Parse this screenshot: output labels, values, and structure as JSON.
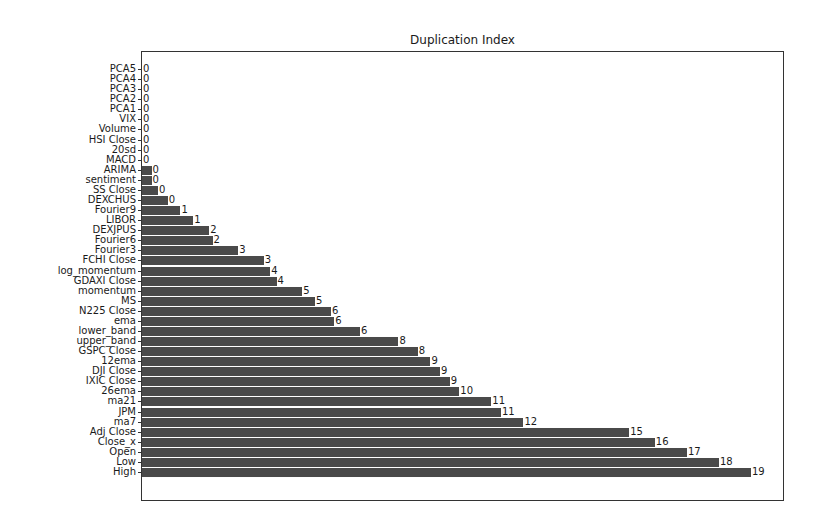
{
  "chart_data": {
    "type": "bar",
    "orientation": "horizontal",
    "title": "Duplication Index",
    "xlabel": "",
    "ylabel": "",
    "xlim": [
      0,
      20
    ],
    "grid": false,
    "legend": null,
    "bar_color": "#4a4a4a",
    "categories": [
      "PCA5",
      "PCA4",
      "PCA3",
      "PCA2",
      "PCA1",
      "VIX",
      "Volume",
      "HSI Close",
      "20sd",
      "MACD",
      "ARIMA",
      "sentiment",
      "SS Close",
      "DEXCHUS",
      "Fourier9",
      "LIBOR",
      "DEXJPUS",
      "Fourier6",
      "Fourier3",
      "FCHI Close",
      "log_momentum",
      "GDAXI Close",
      "momentum",
      "MS",
      "N225 Close",
      "ema",
      "lower_band",
      "upper_band",
      "GSPC Close",
      "12ema",
      "DJI Close",
      "IXIC Close",
      "26ema",
      "ma21",
      "JPM",
      "ma7",
      "Adj Close",
      "Close_x",
      "Open",
      "Low",
      "High"
    ],
    "values": [
      0,
      0,
      0,
      0,
      0,
      0,
      0,
      0,
      0,
      0,
      0.3,
      0.3,
      0.5,
      0.8,
      1.2,
      1.6,
      2.1,
      2.2,
      3.0,
      3.8,
      4.0,
      4.2,
      5.0,
      5.4,
      5.9,
      6.0,
      6.8,
      8.0,
      8.6,
      9.0,
      9.3,
      9.6,
      9.9,
      10.9,
      11.2,
      11.9,
      15.2,
      16.0,
      17.0,
      18.0,
      19.0
    ],
    "value_labels": [
      "0",
      "0",
      "0",
      "0",
      "0",
      "0",
      "0",
      "0",
      "0",
      "0",
      "0",
      "0",
      "0",
      "0",
      "1",
      "1",
      "2",
      "2",
      "3",
      "3",
      "4",
      "4",
      "5",
      "5",
      "6",
      "6",
      "6",
      "8",
      "8",
      "9",
      "9",
      "9",
      "10",
      "11",
      "11",
      "12",
      "15",
      "16",
      "17",
      "18",
      "19"
    ]
  }
}
